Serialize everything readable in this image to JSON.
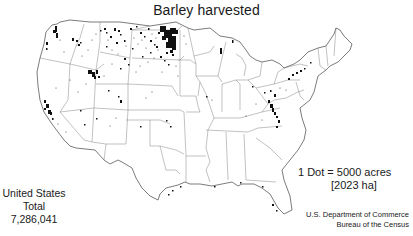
{
  "title": "Barley harvested",
  "total": {
    "line1": "United States",
    "line2": "Total",
    "value": "7,286,041"
  },
  "legend": {
    "line1": "1 Dot = 5000 acres",
    "line2": "[2023 ha]"
  },
  "source": {
    "line1": "U.S. Department of Commerce",
    "line2": "Bureau of the Census"
  },
  "colors": {
    "outline": "#444444",
    "dots": "#111111",
    "background": "#ffffff"
  }
}
